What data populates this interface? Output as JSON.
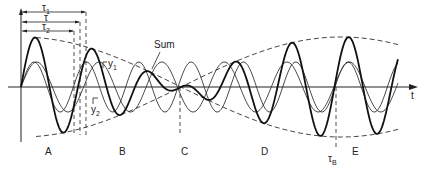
{
  "figure": {
    "axis": {
      "time_label": "t"
    },
    "wave_labels": {
      "y1": "y",
      "y1_sub": "1",
      "y2": "y",
      "y2_sub": "2",
      "sum": "Sum"
    },
    "period_labels": {
      "tau1": "τ",
      "tau1_sub": "1",
      "tau": "τ",
      "tau2": "τ",
      "tau2_sub": "2",
      "tauB": "τ",
      "tauB_sub": "B"
    },
    "region_labels": [
      "A",
      "B",
      "C",
      "D",
      "E"
    ],
    "params": {
      "origin_x": 21,
      "axis_y": 87,
      "x_end": 398,
      "amplitude": 25,
      "mean_period": 57,
      "beat_period": 320,
      "node_x": 180
    },
    "colors": {
      "ink": "#222222",
      "background": "#ffffff"
    }
  }
}
